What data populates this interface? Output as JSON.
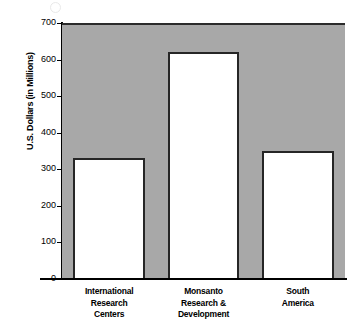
{
  "chart_data": {
    "type": "bar",
    "title": "",
    "subtitle": "",
    "xlabel": "",
    "ylabel": "U.S. Dollars (in Millions)",
    "categories": [
      "International Research Centers",
      "Monsanto Research & Development",
      "South America"
    ],
    "category_lines": [
      [
        "International",
        "Research",
        "Centers"
      ],
      [
        "Monsanto",
        "Research &",
        "Development"
      ],
      [
        "South",
        "America"
      ]
    ],
    "values": [
      330,
      620,
      350
    ],
    "ylim": [
      0,
      700
    ],
    "yticks": [
      0,
      100,
      200,
      300,
      400,
      500,
      600,
      700
    ],
    "ytick_labels": [
      "0",
      "100",
      "200",
      "300",
      "400",
      "500",
      "600",
      "700"
    ],
    "grid": false,
    "legend": "none",
    "colors": {
      "plot_background": "#a8a8a8",
      "bar_fill": "#ffffff",
      "bar_outline": "#262626",
      "axis": "#000000",
      "text": "#000000",
      "page_background": "#ffffff"
    }
  }
}
